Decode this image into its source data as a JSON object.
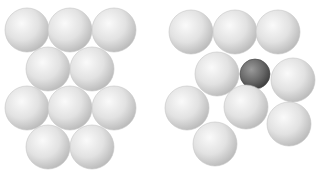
{
  "diagram": {
    "background": "#ffffff",
    "sphere_color_light": "#e4e4e4",
    "sphere_color_dark": "#6a6a6a",
    "groups": [
      {
        "name": "close-packed-layer",
        "spheres": [
          {
            "x": 27,
            "y": 30,
            "r": 22,
            "kind": "light"
          },
          {
            "x": 70,
            "y": 30,
            "r": 22,
            "kind": "light"
          },
          {
            "x": 114,
            "y": 30,
            "r": 22,
            "kind": "light"
          },
          {
            "x": 48,
            "y": 69,
            "r": 22,
            "kind": "light"
          },
          {
            "x": 92,
            "y": 69,
            "r": 22,
            "kind": "light"
          },
          {
            "x": 27,
            "y": 108,
            "r": 22,
            "kind": "light"
          },
          {
            "x": 70,
            "y": 108,
            "r": 22,
            "kind": "light"
          },
          {
            "x": 114,
            "y": 108,
            "r": 22,
            "kind": "light"
          },
          {
            "x": 48,
            "y": 147,
            "r": 22,
            "kind": "light"
          },
          {
            "x": 92,
            "y": 147,
            "r": 22,
            "kind": "light"
          }
        ]
      },
      {
        "name": "layer-with-impurity",
        "spheres": [
          {
            "x": 191,
            "y": 32,
            "r": 22,
            "kind": "light"
          },
          {
            "x": 235,
            "y": 32,
            "r": 22,
            "kind": "light"
          },
          {
            "x": 278,
            "y": 32,
            "r": 22,
            "kind": "light"
          },
          {
            "x": 217,
            "y": 74,
            "r": 22,
            "kind": "light"
          },
          {
            "x": 255,
            "y": 74,
            "r": 15,
            "kind": "dark"
          },
          {
            "x": 293,
            "y": 80,
            "r": 22,
            "kind": "light"
          },
          {
            "x": 187,
            "y": 108,
            "r": 22,
            "kind": "light"
          },
          {
            "x": 246,
            "y": 107,
            "r": 22,
            "kind": "light"
          },
          {
            "x": 289,
            "y": 124,
            "r": 22,
            "kind": "light"
          },
          {
            "x": 215,
            "y": 144,
            "r": 22,
            "kind": "light"
          }
        ]
      }
    ]
  }
}
